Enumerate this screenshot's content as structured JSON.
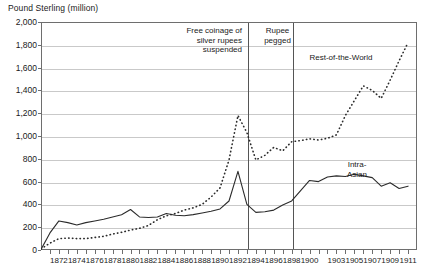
{
  "chart_data": {
    "type": "line",
    "title": "",
    "ylabel": "Pound Sterling (million)",
    "xlabel": "",
    "ylim": [
      0,
      2000
    ],
    "ytick_step": 200,
    "yticks": [
      "0",
      "200",
      "400",
      "600",
      "800",
      "1,000",
      "1,200",
      "1,400",
      "1,600",
      "1,800",
      "2,000"
    ],
    "xlim": [
      1870,
      1912
    ],
    "grid": true,
    "legend_position": "inline-annotations",
    "xticks_labeled": [
      "1872",
      "1874",
      "1876",
      "1878",
      "1880",
      "1882",
      "1884",
      "1886",
      "1888",
      "1890",
      "1892",
      "1894",
      "1896",
      "1898",
      "1900",
      "1903",
      "1905",
      "1907",
      "1909",
      "1911"
    ],
    "xtick_years_labeled": [
      1872,
      1874,
      1876,
      1878,
      1880,
      1882,
      1884,
      1886,
      1888,
      1890,
      1892,
      1894,
      1896,
      1898,
      1900,
      1903,
      1905,
      1907,
      1909,
      1911
    ],
    "x": [
      1870,
      1871,
      1872,
      1873,
      1874,
      1875,
      1876,
      1877,
      1878,
      1879,
      1880,
      1881,
      1882,
      1883,
      1884,
      1885,
      1886,
      1887,
      1888,
      1889,
      1890,
      1891,
      1892,
      1893,
      1894,
      1895,
      1896,
      1897,
      1898,
      1899,
      1900,
      1901,
      1902,
      1903,
      1904,
      1905,
      1906,
      1907,
      1908,
      1909,
      1910,
      1911
    ],
    "series": [
      {
        "name": "Intra-Asian",
        "style": "solid",
        "color": "#2b2b2b",
        "values": [
          5,
          150,
          255,
          240,
          220,
          240,
          255,
          270,
          290,
          310,
          355,
          290,
          285,
          290,
          320,
          305,
          300,
          310,
          325,
          340,
          360,
          430,
          690,
          400,
          330,
          335,
          350,
          395,
          430,
          520,
          610,
          600,
          640,
          650,
          645,
          665,
          650,
          635,
          560,
          590,
          540,
          560
        ]
      },
      {
        "name": "Rest-of-the-World",
        "style": "dotted",
        "color": "#2b2b2b",
        "values": [
          10,
          60,
          100,
          105,
          100,
          100,
          110,
          120,
          140,
          155,
          175,
          190,
          215,
          265,
          300,
          320,
          350,
          370,
          400,
          465,
          545,
          790,
          1180,
          1030,
          790,
          830,
          900,
          870,
          950,
          960,
          975,
          965,
          980,
          1010,
          1180,
          1310,
          1440,
          1400,
          1330,
          1490,
          1660,
          1820
        ]
      }
    ],
    "annotations": [
      {
        "name": "free-coinage",
        "text": "Free coinage of\nsilver rupees\nsuspended",
        "at_year": 1893
      },
      {
        "name": "rupee-pegged",
        "text": "Rupee\npegged",
        "at_year": 1898
      }
    ],
    "vertical_markers": [
      1893,
      1898
    ],
    "series_labels": [
      {
        "name": "Rest-of-the-World",
        "text": "Rest-of-the-World"
      },
      {
        "name": "Intra-Asian",
        "text": "Intra-\nAsian"
      }
    ]
  }
}
